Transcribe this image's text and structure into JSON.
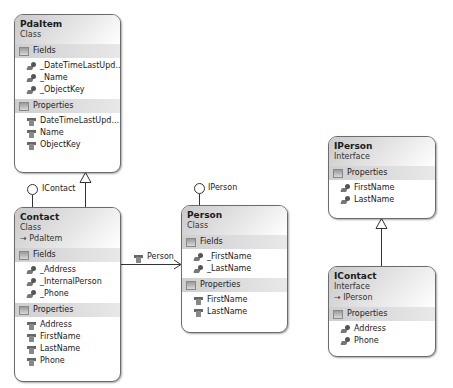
{
  "classes": {
    "pdaitem": {
      "name": "PdaItem",
      "kind": "Class",
      "fields_label": "Fields",
      "fields": [
        "_DateTimeLastUpd...",
        "_Name",
        "_ObjectKey"
      ],
      "properties_label": "Properties",
      "properties": [
        "DateTimeLastUpd...",
        "Name",
        "ObjectKey"
      ]
    },
    "contact": {
      "name": "Contact",
      "kind": "Class",
      "inherits": "→ PdaItem",
      "fields_label": "Fields",
      "fields": [
        "_Address",
        "_InternalPerson",
        "_Phone"
      ],
      "properties_label": "Properties",
      "properties": [
        "Address",
        "FirstName",
        "LastName",
        "Phone"
      ]
    },
    "person": {
      "name": "Person",
      "kind": "Class",
      "fields_label": "Fields",
      "fields": [
        "_FirstName",
        "_LastName"
      ],
      "properties_label": "Properties",
      "properties": [
        "FirstName",
        "LastName"
      ]
    },
    "iperson": {
      "name": "IPerson",
      "kind": "Interface",
      "properties_label": "Properties",
      "properties": [
        "FirstName",
        "LastName"
      ]
    },
    "icontact": {
      "name": "IContact",
      "kind": "Interface",
      "inherits": "→ IPerson",
      "properties_label": "Properties",
      "properties": [
        "Address",
        "Phone"
      ]
    }
  },
  "connectors": {
    "contact_lollipop": "IContact",
    "person_lollipop": "IPerson",
    "association_label": "Person"
  }
}
